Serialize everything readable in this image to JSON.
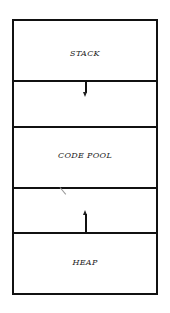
{
  "diagram": {
    "sections": [
      {
        "id": "stack",
        "label": "STACK"
      },
      {
        "id": "stack-growth",
        "label": ""
      },
      {
        "id": "code-pool",
        "label": "CODE POOL"
      },
      {
        "id": "heap-growth",
        "label": ""
      },
      {
        "id": "heap",
        "label": "HEAP"
      }
    ],
    "arrows": [
      {
        "from": "stack",
        "direction": "down"
      },
      {
        "from": "heap",
        "direction": "up"
      }
    ],
    "colors": {
      "line": "#111111",
      "background": "#ffffff",
      "text": "#222222"
    }
  }
}
